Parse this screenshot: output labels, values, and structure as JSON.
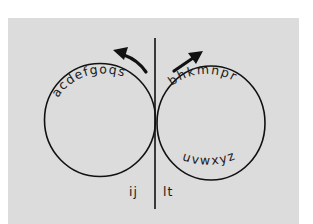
{
  "diagram": {
    "title": "",
    "colors": {
      "outer_background": "#ffffff",
      "panel_background": "#dcdcdc",
      "stroke": "#111111"
    },
    "left_loop": {
      "top_letters": "acdefgoqs",
      "arrow_direction": "counter-clockwise (up-left)"
    },
    "right_loop": {
      "top_letters": "bhkmnpr",
      "bottom_letters": "uvwxyz",
      "arrow_direction": "clockwise (up-right)"
    },
    "stem_labels": {
      "left": "ij",
      "right": "lt"
    }
  }
}
